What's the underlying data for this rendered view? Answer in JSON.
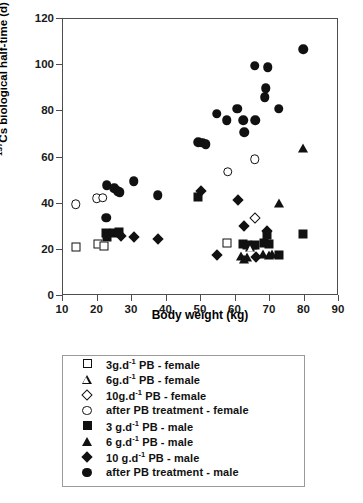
{
  "chart_data": {
    "type": "scatter",
    "title": "",
    "xlabel": "Body weight (kg)",
    "ylabel_prefix": "137",
    "ylabel": "Cs biological half-time (d)",
    "xlim": [
      10,
      90
    ],
    "ylim": [
      0,
      120
    ],
    "xticks": [
      10,
      20,
      30,
      40,
      50,
      60,
      70,
      80,
      90
    ],
    "yticks": [
      0,
      20,
      40,
      60,
      80,
      100,
      120
    ],
    "grid": false,
    "legend_position": "below-plot",
    "series": [
      {
        "name": "3g.d-1 PB - female",
        "label": "3g.d",
        "exponent": "-1",
        "label_tail": " PB - female",
        "marker": "square-open",
        "points": [
          [
            14.0,
            21.0
          ],
          [
            20.3,
            22.3
          ],
          [
            22.2,
            21.2
          ],
          [
            57.8,
            22.5
          ]
        ]
      },
      {
        "name": "6g.d-1 PB - female",
        "label": "6g.d",
        "exponent": "-1",
        "label_tail": " PB - female",
        "marker": "triangle-open",
        "points": [
          [
            64.6,
            20.6
          ]
        ]
      },
      {
        "name": "10g.d-1 PB - female",
        "label": "10g.d",
        "exponent": "-1",
        "label_tail": " PB - female",
        "marker": "diamond-open",
        "points": [
          [
            65.8,
            33.4
          ]
        ]
      },
      {
        "name": "after PB treatment - female",
        "label": "after PB treatment - female",
        "exponent": "",
        "label_tail": "",
        "marker": "circle-open",
        "points": [
          [
            14.0,
            39.3
          ],
          [
            20.0,
            42.0
          ],
          [
            21.8,
            42.1
          ],
          [
            58.0,
            53.4
          ],
          [
            65.8,
            58.8
          ]
        ]
      },
      {
        "name": "3 g.d-1 PB - male",
        "label": "3 g.d",
        "exponent": "-1",
        "label_tail": " PB - male",
        "marker": "square-filled",
        "points": [
          [
            22.8,
            27.0
          ],
          [
            23.0,
            25.0
          ],
          [
            25.2,
            26.8
          ],
          [
            26.4,
            27.4
          ],
          [
            49.5,
            42.5
          ],
          [
            62.5,
            22.0
          ],
          [
            63.6,
            21.8
          ],
          [
            66.0,
            21.6
          ],
          [
            68.6,
            22.4
          ],
          [
            69.4,
            26.2
          ],
          [
            70.0,
            22.0
          ],
          [
            72.8,
            17.4
          ],
          [
            79.8,
            26.5
          ]
        ]
      },
      {
        "name": "6 g.d-1 PB - male",
        "label": "6 g.d",
        "exponent": "-1",
        "label_tail": " PB - male",
        "marker": "triangle-filled",
        "points": [
          [
            62.0,
            17.0
          ],
          [
            62.8,
            15.4
          ],
          [
            63.6,
            16.4
          ],
          [
            65.0,
            21.6
          ],
          [
            68.4,
            17.6
          ],
          [
            70.0,
            17.4
          ],
          [
            71.0,
            17.6
          ],
          [
            73.0,
            40.0
          ],
          [
            79.9,
            63.6
          ]
        ]
      },
      {
        "name": "10 g.d-1 PB - male",
        "label": "10 g.d",
        "exponent": "-1",
        "label_tail": " PB - male",
        "marker": "diamond-filled",
        "points": [
          [
            27.0,
            25.4
          ],
          [
            30.9,
            25.3
          ],
          [
            37.8,
            24.4
          ],
          [
            50.4,
            45.2
          ],
          [
            54.8,
            17.4
          ],
          [
            61.0,
            41.2
          ],
          [
            62.8,
            29.8
          ],
          [
            66.2,
            16.4
          ],
          [
            69.4,
            27.6
          ]
        ]
      },
      {
        "name": "after PB treatment - male",
        "label": "after PB treatment - male",
        "exponent": "",
        "label_tail": "",
        "marker": "circle-filled",
        "points": [
          [
            22.8,
            33.4
          ],
          [
            23.0,
            47.6
          ],
          [
            25.2,
            46.2
          ],
          [
            26.2,
            45.0
          ],
          [
            26.8,
            44.6
          ],
          [
            30.8,
            49.2
          ],
          [
            37.8,
            43.2
          ],
          [
            49.5,
            66.2
          ],
          [
            50.6,
            66.0
          ],
          [
            51.6,
            65.4
          ],
          [
            54.8,
            78.6
          ],
          [
            57.8,
            75.6
          ],
          [
            60.8,
            80.6
          ],
          [
            62.6,
            75.6
          ],
          [
            62.8,
            70.6
          ],
          [
            65.8,
            99.4
          ],
          [
            66.0,
            75.6
          ],
          [
            68.8,
            85.6
          ],
          [
            69.0,
            89.6
          ],
          [
            69.6,
            98.6
          ],
          [
            72.8,
            80.6
          ],
          [
            79.9,
            106.4
          ]
        ]
      }
    ]
  }
}
